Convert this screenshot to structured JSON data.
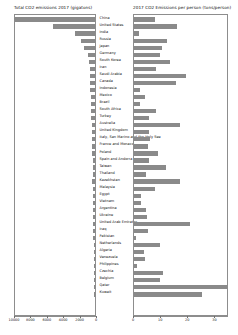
{
  "left_panel": {
    "title": "Total CO2 emissions 2017 (gigatons)"
  },
  "right_panel": {
    "title": "2017 CO2 Emissions per person (tons/person)"
  },
  "colors": {
    "bar": "#8a8a8a",
    "axis": "#8d8d8d",
    "text": "#111111"
  },
  "chart_data": {
    "type": "bar",
    "layout": "back-to-back horizontal bars with centered category labels",
    "categories": [
      "China",
      "United States",
      "India",
      "Russia",
      "Japan",
      "Germany",
      "South Korea",
      "Iran",
      "Saudi Arabia",
      "Canada",
      "Indonesia",
      "Mexico",
      "Brazil",
      "South Africa",
      "Turkey",
      "Australia",
      "United Kingdom",
      "Italy, San Marino and the Holy See",
      "France and Monaco",
      "Poland",
      "Spain and Andorra",
      "Taiwan",
      "Thailand",
      "Kazakhstan",
      "Malaysia",
      "Egypt",
      "Vietnam",
      "Argentina",
      "Ukraine",
      "United Arab Emirates",
      "Iraq",
      "Pakistan",
      "Netherlands",
      "Algeria",
      "Venezuela",
      "Philippines",
      "Czechia",
      "Belgium",
      "Qatar",
      "Kuwait"
    ],
    "series": [
      {
        "name": "Total CO2 emissions 2017 (gigatons)",
        "panel": "left",
        "direction": "right-to-left",
        "xlabel": "",
        "ylabel": "",
        "xlim": [
          10000,
          0
        ],
        "xticks": [
          10000,
          8000,
          6000,
          4000,
          2000,
          0
        ],
        "xticklabels": [
          "10000",
          "8000",
          "6000",
          "4000",
          "2000",
          "0"
        ],
        "grid": false,
        "values": [
          10877,
          5107,
          2454,
          1765,
          1320,
          799,
          673,
          672,
          635,
          573,
          563,
          490,
          476,
          456,
          448,
          414,
          379,
          355,
          356,
          341,
          259,
          276,
          302,
          314,
          248,
          248,
          231,
          204,
          218,
          201,
          194,
          190,
          164,
          150,
          127,
          129,
          112,
          110,
          103,
          102
        ]
      },
      {
        "name": "2017 CO2 Emissions per person (tons/person)",
        "panel": "right",
        "direction": "left-to-right",
        "xlabel": "",
        "ylabel": "",
        "xlim": [
          0,
          35
        ],
        "xticks": [
          0,
          10,
          20,
          30
        ],
        "xticklabels": [
          "0",
          "10",
          "20",
          "30"
        ],
        "grid": false,
        "values": [
          7.7,
          15.7,
          1.8,
          12.2,
          10.4,
          9.7,
          13.2,
          8.2,
          19.0,
          15.6,
          2.1,
          3.9,
          2.3,
          8.0,
          5.5,
          16.9,
          5.7,
          5.9,
          5.3,
          9.0,
          5.6,
          11.7,
          4.4,
          17.1,
          7.9,
          2.5,
          2.4,
          4.6,
          4.9,
          20.8,
          5.0,
          0.9,
          9.6,
          3.7,
          4.1,
          1.2,
          10.6,
          9.7,
          36.8,
          25.2
        ]
      }
    ]
  }
}
